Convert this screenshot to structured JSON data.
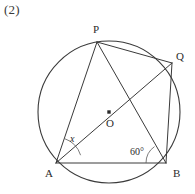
{
  "figure": {
    "problem_number": "(2)",
    "circle": {
      "center_label": "O",
      "cx": 109,
      "cy": 112,
      "r": 71,
      "center_dot": true
    },
    "points": [
      {
        "label": "P",
        "x": 97,
        "y": 42,
        "label_x": 93,
        "label_y": 33
      },
      {
        "label": "Q",
        "x": 172,
        "y": 63,
        "label_x": 176,
        "label_y": 60
      },
      {
        "label": "A",
        "x": 56,
        "y": 163,
        "label_x": 45,
        "label_y": 177
      },
      {
        "label": "B",
        "x": 166,
        "y": 163,
        "label_x": 173,
        "label_y": 177
      },
      {
        "label": "O",
        "x": 109,
        "y": 112,
        "label_x": 106,
        "label_y": 127
      }
    ],
    "segments": [
      {
        "name": "segment-PA",
        "from": "P",
        "to": "A"
      },
      {
        "name": "segment-PQ",
        "from": "P",
        "to": "Q"
      },
      {
        "name": "segment-PB",
        "from": "P",
        "to": "B"
      },
      {
        "name": "segment-AQ",
        "from": "A",
        "to": "Q"
      },
      {
        "name": "segment-AB",
        "from": "A",
        "to": "B"
      },
      {
        "name": "segment-QB",
        "from": "Q",
        "to": "B"
      }
    ],
    "angles": [
      {
        "name": "angle-at-A",
        "label": "x",
        "vertex": "A",
        "between": [
          "P",
          "Q"
        ],
        "label_x": 70,
        "label_y": 142,
        "italic": true
      },
      {
        "name": "angle-at-B",
        "label": "60°",
        "vertex": "B",
        "between": [
          "A",
          "P"
        ],
        "label_x": 130,
        "label_y": 155,
        "italic": false
      }
    ],
    "colors": {
      "stroke": "#3a3a3a",
      "arc": "#5a5a5a",
      "text": "#2b2b2b",
      "background": "#ffffff"
    }
  }
}
